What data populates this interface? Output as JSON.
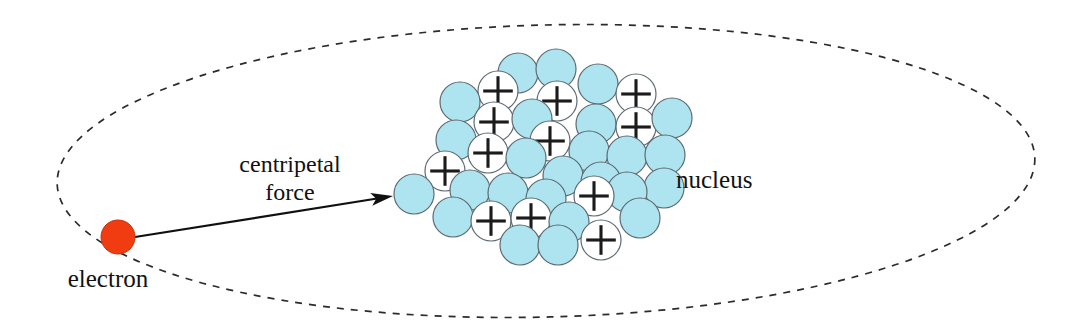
{
  "diagram": {
    "labels": {
      "electron": "electron",
      "nucleus": "nucleus",
      "force_line1": "centripetal",
      "force_line2": "force"
    },
    "colors": {
      "nucleon_blue": "#AEE4F0",
      "nucleon_outline": "#5d6a72",
      "proton_fill": "#ffffff",
      "electron": "#F03C10",
      "orbit_stroke": "#2b2b2b",
      "arrow": "#101010",
      "background": "#ffffff"
    },
    "orbit": {
      "shape": "ellipse",
      "center_x": 546,
      "center_y": 171,
      "radius_x": 489,
      "radius_y": 146,
      "rotation_deg": -1.5,
      "dash": "7 7",
      "style": "dashed"
    },
    "electron_particle": {
      "cx": 118,
      "cy": 237,
      "r": 17
    },
    "force_arrow": {
      "x1": 135,
      "y1": 237,
      "x2": 393,
      "y2": 196,
      "head_length": 22,
      "head_width": 13
    },
    "label_positions": {
      "electron": {
        "x": 108,
        "y": 287,
        "anchor": "middle"
      },
      "nucleus": {
        "x": 676,
        "y": 188,
        "anchor": "start"
      },
      "force_line1": {
        "x": 290,
        "y": 172,
        "anchor": "middle"
      },
      "force_line2": {
        "x": 290,
        "y": 200,
        "anchor": "middle"
      }
    },
    "nucleus_cluster": {
      "radius": 20,
      "count_total": 36,
      "count_protons": 15,
      "count_neutrons": 21,
      "nucleons": [
        {
          "cx": 518,
          "cy": 73,
          "type": "neutron"
        },
        {
          "cx": 556,
          "cy": 69,
          "type": "neutron"
        },
        {
          "cx": 598,
          "cy": 84,
          "type": "neutron"
        },
        {
          "cx": 498,
          "cy": 91,
          "type": "proton"
        },
        {
          "cx": 460,
          "cy": 102,
          "type": "neutron"
        },
        {
          "cx": 636,
          "cy": 94,
          "type": "proton"
        },
        {
          "cx": 557,
          "cy": 101,
          "type": "proton"
        },
        {
          "cx": 596,
          "cy": 124,
          "type": "neutron"
        },
        {
          "cx": 494,
          "cy": 122,
          "type": "proton"
        },
        {
          "cx": 532,
          "cy": 119,
          "type": "neutron"
        },
        {
          "cx": 636,
          "cy": 127,
          "type": "proton"
        },
        {
          "cx": 672,
          "cy": 118,
          "type": "neutron"
        },
        {
          "cx": 456,
          "cy": 140,
          "type": "neutron"
        },
        {
          "cx": 550,
          "cy": 141,
          "type": "proton"
        },
        {
          "cx": 589,
          "cy": 151,
          "type": "neutron"
        },
        {
          "cx": 627,
          "cy": 156,
          "type": "neutron"
        },
        {
          "cx": 665,
          "cy": 155,
          "type": "neutron"
        },
        {
          "cx": 488,
          "cy": 153,
          "type": "proton"
        },
        {
          "cx": 526,
          "cy": 158,
          "type": "neutron"
        },
        {
          "cx": 445,
          "cy": 171,
          "type": "proton"
        },
        {
          "cx": 563,
          "cy": 176,
          "type": "neutron"
        },
        {
          "cx": 601,
          "cy": 182,
          "type": "neutron"
        },
        {
          "cx": 664,
          "cy": 188,
          "type": "neutron"
        },
        {
          "cx": 627,
          "cy": 192,
          "type": "neutron"
        },
        {
          "cx": 414,
          "cy": 194,
          "type": "neutron"
        },
        {
          "cx": 470,
          "cy": 190,
          "type": "neutron"
        },
        {
          "cx": 508,
          "cy": 193,
          "type": "neutron"
        },
        {
          "cx": 546,
          "cy": 199,
          "type": "neutron"
        },
        {
          "cx": 594,
          "cy": 196,
          "type": "proton"
        },
        {
          "cx": 453,
          "cy": 217,
          "type": "neutron"
        },
        {
          "cx": 491,
          "cy": 221,
          "type": "proton"
        },
        {
          "cx": 531,
          "cy": 218,
          "type": "proton"
        },
        {
          "cx": 569,
          "cy": 222,
          "type": "neutron"
        },
        {
          "cx": 640,
          "cy": 218,
          "type": "neutron"
        },
        {
          "cx": 520,
          "cy": 245,
          "type": "neutron"
        },
        {
          "cx": 558,
          "cy": 245,
          "type": "neutron"
        },
        {
          "cx": 601,
          "cy": 240,
          "type": "proton"
        }
      ]
    }
  }
}
